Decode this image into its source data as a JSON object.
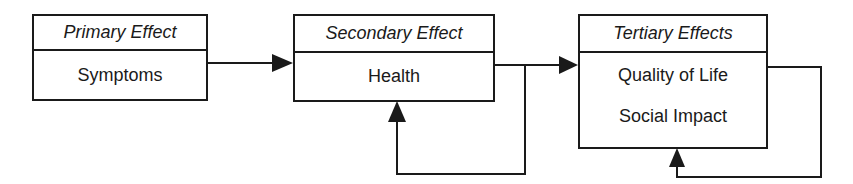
{
  "diagram": {
    "boxes": [
      {
        "header": "Primary Effect",
        "items": [
          "Symptoms"
        ]
      },
      {
        "header": "Secondary Effect",
        "items": [
          "Health"
        ]
      },
      {
        "header": "Tertiary Effects",
        "items": [
          "Quality of Life",
          "Social Impact"
        ]
      }
    ],
    "connections": [
      {
        "from": "Primary Effect",
        "to": "Secondary Effect",
        "type": "arrow"
      },
      {
        "from": "Secondary Effect",
        "to": "Tertiary Effects",
        "type": "arrow"
      },
      {
        "from": "Secondary Effect",
        "to": "Secondary Effect",
        "type": "feedback-loop"
      },
      {
        "from": "Tertiary Effects",
        "to": "Tertiary Effects",
        "type": "feedback-loop"
      }
    ],
    "colors": {
      "stroke": "#1a1a1a",
      "background": "#ffffff"
    }
  }
}
